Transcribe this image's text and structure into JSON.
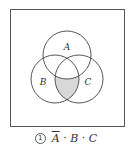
{
  "diagram": {
    "type": "venn",
    "sets": [
      {
        "label": "A",
        "cx": 67,
        "cy": 55,
        "r": 24
      },
      {
        "label": "B",
        "cx": 55,
        "cy": 79,
        "r": 24
      },
      {
        "label": "C",
        "cx": 79,
        "cy": 79,
        "r": 24
      }
    ],
    "shaded_region": "not A and B and C",
    "shade_color": "#d8d8d8",
    "stroke_color": "#444444",
    "frame_color": "#555555"
  },
  "caption": {
    "number": "1",
    "expr_a": "A",
    "sep1": "·",
    "expr_b": "B",
    "sep2": "·",
    "expr_c": "C"
  }
}
